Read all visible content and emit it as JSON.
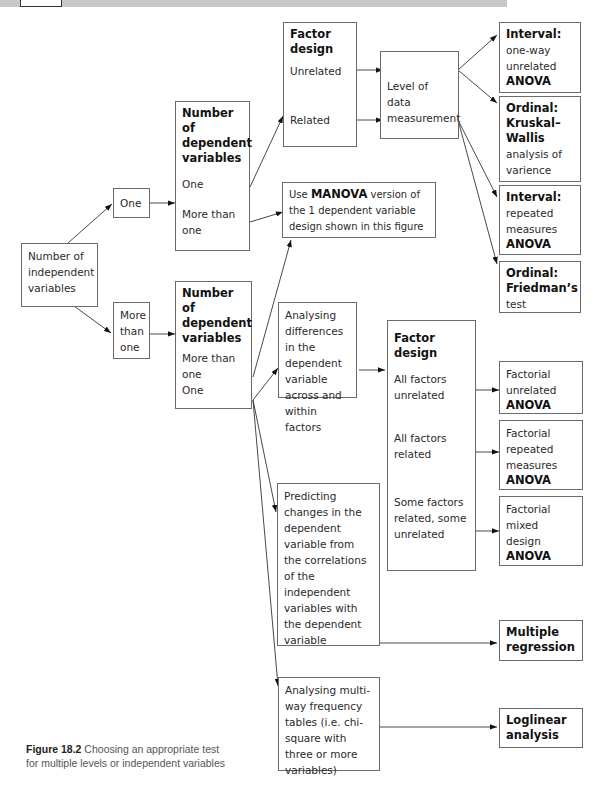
{
  "nodes": {
    "num_iv": {
      "text": "Number of independent variables"
    },
    "iv_one": {
      "text": "One"
    },
    "iv_more": {
      "text": "More than one"
    },
    "dv_top": {
      "title": "Number of dependent variables",
      "opt1": "One",
      "opt2": "More than one"
    },
    "dv_bottom": {
      "title": "Number of dependent variables",
      "opt1": "More than one",
      "opt2": "One"
    },
    "factor_top": {
      "title": "Factor design",
      "opt1": "Unrelated",
      "opt2": "Related"
    },
    "level_data": {
      "text": "Level of data measurement"
    },
    "manova": {
      "pre": "Use ",
      "bold": "MANOVA",
      "post": " version of the 1 dependent variable design shown in this figure"
    },
    "result_interval_oneway": {
      "title": "Interval:",
      "desc": "one-way unrelated",
      "test": "ANOVA"
    },
    "result_ordinal_kw": {
      "title": "Ordinal: Kruskal–Wallis",
      "desc": "analysis of varience"
    },
    "result_interval_rm": {
      "title": "Interval:",
      "desc": "repeated measures",
      "test": "ANOVA"
    },
    "result_ordinal_friedman": {
      "title": "Ordinal: Friedman’s",
      "desc": "test"
    },
    "analysing_diff": {
      "text": "Analysing differences in the dependent variable across and within factors"
    },
    "factor_bottom": {
      "title": "Factor design",
      "opt1": "All factors unrelated",
      "opt2": "All factors related",
      "opt3": "Some factors related, some unrelated"
    },
    "fact_unrelated": {
      "desc": "Factorial unrelated",
      "test": "ANOVA"
    },
    "fact_repeated": {
      "desc": "Factorial repeated measures",
      "test": "ANOVA"
    },
    "fact_mixed": {
      "desc": "Factorial mixed design",
      "test": "ANOVA"
    },
    "predicting": {
      "text": "Predicting changes in the dependent variable from the correlations of the independent variables with the dependent variable"
    },
    "multiple_regression": {
      "text": "Multiple regression"
    },
    "analysing_multiway": {
      "text": "Analysing multi-way frequency tables (i.e. chi-square with three or more variables)"
    },
    "loglinear": {
      "text": "Loglinear analysis"
    }
  },
  "caption": {
    "label": "Figure 18.2",
    "text": " Choosing an appropriate test for multiple levels or independent variables"
  }
}
